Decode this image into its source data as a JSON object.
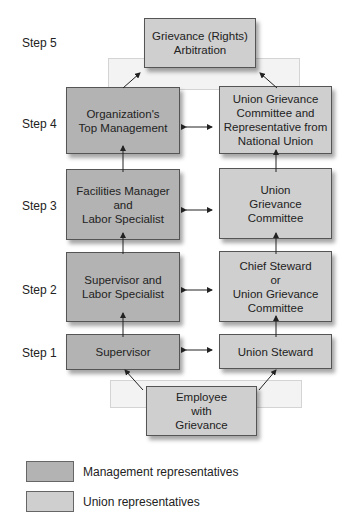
{
  "steps": [
    "Step 5",
    "Step 4",
    "Step 3",
    "Step 2",
    "Step 1"
  ],
  "boxes": {
    "arbitration": "Grievance (Rights)\nArbitration",
    "top_management": "Organization's\nTop Management",
    "national_union": "Union Grievance\nCommittee and\nRepresentative from\nNational Union",
    "facilities_manager": "Facilities Manager\nand\nLabor Specialist",
    "union_committee": "Union\nGrievance\nCommittee",
    "supervisor_labor": "Supervisor and\nLabor Specialist",
    "chief_steward": "Chief Steward\nor\nUnion Grievance\nCommittee",
    "supervisor": "Supervisor",
    "union_steward": "Union Steward",
    "employee": "Employee\nwith\nGrievance"
  },
  "legend": [
    {
      "label": "Management representatives",
      "color": "#b3b3b3"
    },
    {
      "label": "Union representatives",
      "color": "#cfcfcf"
    }
  ]
}
